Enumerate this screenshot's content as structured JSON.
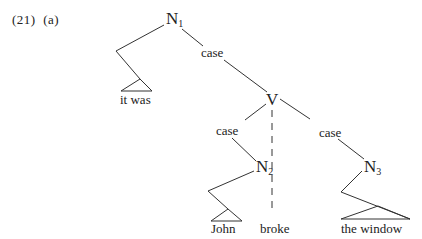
{
  "example": {
    "number": "(21)",
    "sub": "(a)"
  },
  "nodes": {
    "n1": {
      "label": "N",
      "sub": "1"
    },
    "v": {
      "label": "V"
    },
    "n2": {
      "label": "N",
      "sub": "2"
    },
    "n3": {
      "label": "N",
      "sub": "3"
    }
  },
  "edges": {
    "n1_v": "case",
    "v_n2": "case",
    "v_n3": "case"
  },
  "leaves": {
    "n1_left": "it was",
    "n2_left": "John",
    "v_dashed": "broke",
    "n3_right": "the window"
  },
  "colors": {
    "line": "#333333",
    "text": "#222222"
  }
}
